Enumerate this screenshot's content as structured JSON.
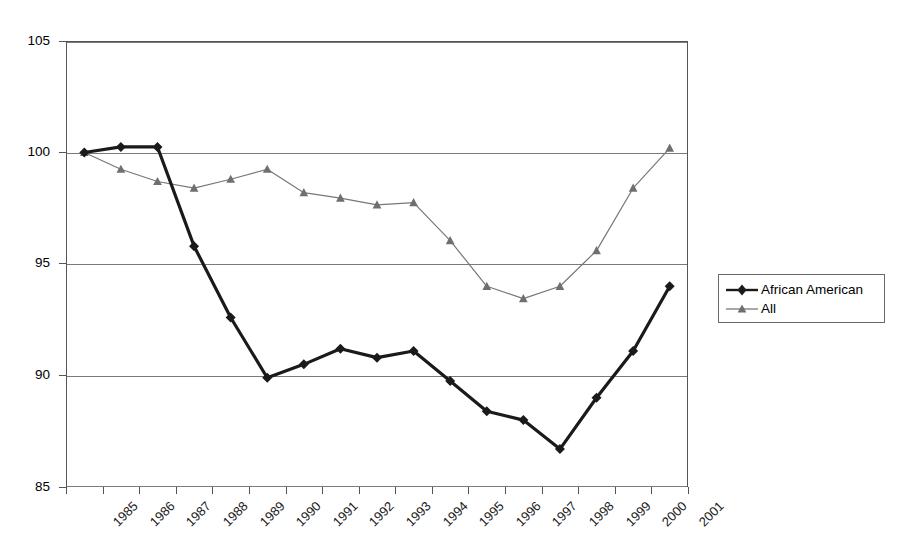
{
  "chart_data": {
    "type": "line",
    "title": "",
    "subtitle": "",
    "xlabel": "",
    "ylabel": "",
    "categories": [
      "1985",
      "1986",
      "1987",
      "1988",
      "1989",
      "1990",
      "1991",
      "1992",
      "1993",
      "1994",
      "1995",
      "1996",
      "1997",
      "1998",
      "1999",
      "2000",
      "2001"
    ],
    "x": [
      "1985",
      "1986",
      "1987",
      "1988",
      "1989",
      "1990",
      "1991",
      "1992",
      "1993",
      "1994",
      "1995",
      "1996",
      "1997",
      "1998",
      "1999",
      "2000"
    ],
    "ylim": [
      85,
      105
    ],
    "yticks": [
      85,
      90,
      95,
      100,
      105
    ],
    "ytick_labels": [
      "85",
      "90",
      "95",
      "100",
      "105"
    ],
    "grid": "horizontal",
    "legend_position": "right",
    "series": [
      {
        "name": "African American",
        "marker": "diamond",
        "color": "#1a1a1a",
        "line_width": 3.2,
        "values": [
          100.0,
          100.25,
          100.25,
          95.8,
          92.6,
          89.9,
          90.5,
          91.2,
          90.8,
          91.1,
          89.75,
          88.4,
          88.0,
          86.7,
          89.0,
          91.1,
          94.0
        ]
      },
      {
        "name": "All",
        "marker": "triangle",
        "color": "#777777",
        "line_width": 1.2,
        "values": [
          100.0,
          99.25,
          98.7,
          98.4,
          98.8,
          99.25,
          98.2,
          97.95,
          97.65,
          97.75,
          96.05,
          94.0,
          93.45,
          94.0,
          95.6,
          98.4,
          100.2
        ]
      }
    ]
  },
  "axes": {
    "y_tick_labels": [
      "105",
      "100",
      "95",
      "90",
      "85"
    ],
    "x_tick_labels": [
      "1985",
      "1986",
      "1987",
      "1988",
      "1989",
      "1990",
      "1991",
      "1992",
      "1993",
      "1994",
      "1995",
      "1996",
      "1997",
      "1998",
      "1999",
      "2000",
      "2001"
    ]
  },
  "legend": {
    "entries": [
      {
        "label": "African American",
        "marker": "diamond-marker-icon",
        "color": "#1a1a1a"
      },
      {
        "label": "All",
        "marker": "triangle-marker-icon",
        "color": "#777777"
      }
    ]
  },
  "colors": {
    "african_american": "#1a1a1a",
    "all": "#777777",
    "gridline": "#7a7a7a",
    "frame": "#555555",
    "background": "#ffffff"
  }
}
